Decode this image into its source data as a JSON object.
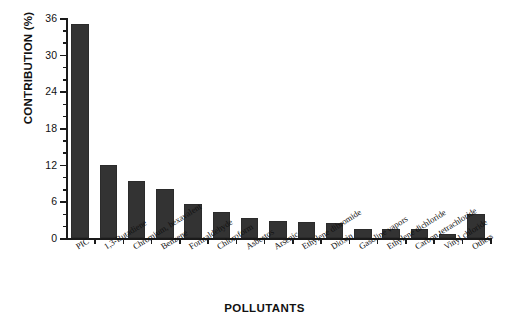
{
  "chart_data": {
    "type": "bar",
    "title": "",
    "xlabel": "POLLUTANTS",
    "ylabel": "CONTRIBUTION (%)",
    "ylim": [
      0,
      36
    ],
    "ytick_step_major": 6,
    "ytick_step_minor": 2,
    "grid": false,
    "legend": null,
    "categories": [
      "PIC",
      "1,3-Butadiene",
      "Chromium, hexavalent",
      "Benzene",
      "Formaldehyde",
      "Chloroform",
      "Asbestos",
      "Arsenic",
      "Ethylene dibromide",
      "Dioxin",
      "Gasoline vapors",
      "Ethylene dichloride",
      "Carbon tetrachloride",
      "Vinyl chloride",
      "Others"
    ],
    "values": [
      35,
      12,
      9.3,
      8,
      5.5,
      4.3,
      3.3,
      2.8,
      2.6,
      2.4,
      1.5,
      1.4,
      1.4,
      0.6,
      4
    ],
    "ytick_labels": [
      "0",
      "6",
      "12",
      "18",
      "24",
      "30",
      "36"
    ],
    "ytick_values": [
      0,
      6,
      12,
      18,
      24,
      30,
      36
    ],
    "ytick_minor_values": [
      2,
      4,
      8,
      10,
      14,
      16,
      20,
      22,
      26,
      28,
      32,
      34
    ],
    "bar_color": "#333333"
  }
}
